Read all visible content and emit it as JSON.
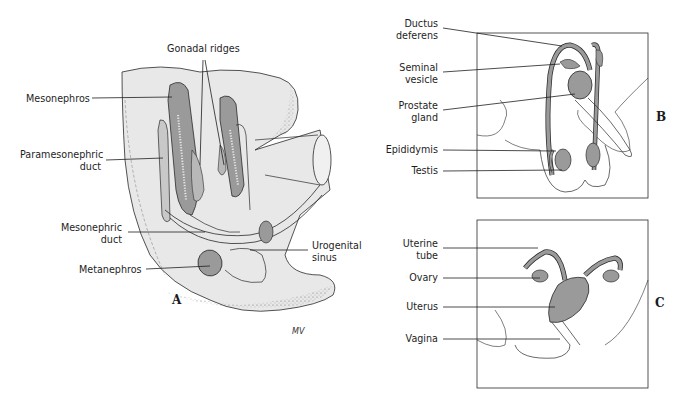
{
  "figure": {
    "panels": {
      "A": {
        "letter": "A",
        "title": "Indifferent stage of urogenital development",
        "labels": {
          "gonadal_ridges": "Gonadal ridges",
          "mesonephros": "Mesonephros",
          "paramesonephric_1": "Paramesonephric",
          "paramesonephric_2": "duct",
          "mesonephric_1": "Mesonephric",
          "mesonephric_2": "duct",
          "metanephros": "Metanephros",
          "urogenital_1": "Urogenital",
          "urogenital_2": "sinus"
        },
        "signature": "MV"
      },
      "B": {
        "letter": "B",
        "labels": {
          "ductus_1": "Ductus",
          "ductus_2": "deferens",
          "seminal_1": "Seminal",
          "seminal_2": "vesicle",
          "prostate_1": "Prostate",
          "prostate_2": "gland",
          "epididymis": "Epididymis",
          "testis": "Testis"
        }
      },
      "C": {
        "letter": "C",
        "labels": {
          "uterine_1": "Uterine",
          "uterine_2": "tube",
          "ovary": "Ovary",
          "uterus": "Uterus",
          "vagina": "Vagina"
        }
      }
    },
    "colors": {
      "organ_fill": "#9a9a9a",
      "light_fill": "#e6e6e6",
      "line": "#2a2a2a"
    }
  }
}
